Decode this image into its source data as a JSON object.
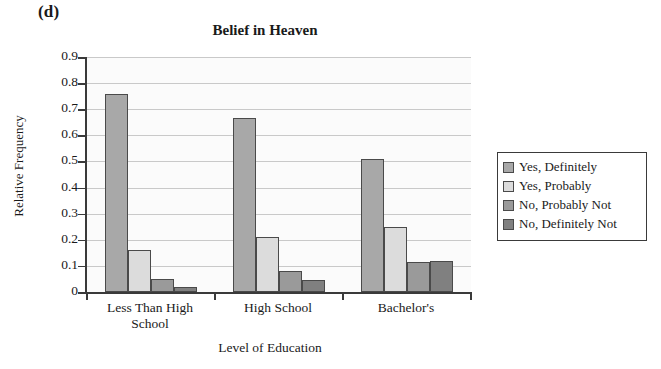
{
  "panel_label": "(d)",
  "chart_data": {
    "type": "bar",
    "title": "Belief in Heaven",
    "xlabel": "Level of Education",
    "ylabel": "Relative Frequency",
    "categories": [
      "Less Than High School",
      "High School",
      "Bachelor's"
    ],
    "category_lines": [
      [
        "Less Than High",
        "School"
      ],
      [
        "High School",
        ""
      ],
      [
        "Bachelor's",
        ""
      ]
    ],
    "series": [
      {
        "name": "Yes, Definitely",
        "color": "#a8a8a8",
        "values": [
          0.76,
          0.665,
          0.51
        ]
      },
      {
        "name": "Yes, Probably",
        "color": "#dcdcdc",
        "values": [
          0.16,
          0.21,
          0.25
        ]
      },
      {
        "name": "No, Probably Not",
        "color": "#9a9a9a",
        "values": [
          0.05,
          0.08,
          0.115
        ]
      },
      {
        "name": "No, Definitely Not",
        "color": "#808080",
        "values": [
          0.02,
          0.045,
          0.12
        ]
      }
    ],
    "ylim": [
      0,
      0.9
    ],
    "ytick_values": [
      0.9,
      0.8,
      0.7,
      0.6,
      0.5,
      0.4,
      0.3,
      0.2,
      0.1,
      0
    ],
    "ytick_labels": [
      "0.9",
      "0.8",
      "0.7",
      "0.6",
      "0.5",
      "0.4",
      "0.3",
      "0.2",
      "0.1",
      "0"
    ],
    "grid": true,
    "legend_position": "right",
    "legend_entries": [
      "Yes, Definitely",
      "Yes, Probably",
      "No, Probably Not",
      "No, Definitely Not"
    ]
  }
}
